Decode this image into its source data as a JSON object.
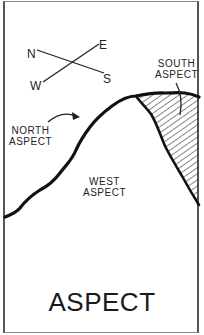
{
  "title": "ASPECT",
  "compass": {
    "north": "N",
    "east": "E",
    "south": "S",
    "west": "W"
  },
  "labels": {
    "north_aspect": [
      "NORTH",
      "ASPECT"
    ],
    "west_aspect": [
      "WEST",
      "ASPECT"
    ],
    "south_aspect": [
      "SOUTH",
      "ASPECT"
    ]
  },
  "colors": {
    "ink": "#1a1a1a",
    "background": "#ffffff",
    "frame": "#555555"
  }
}
